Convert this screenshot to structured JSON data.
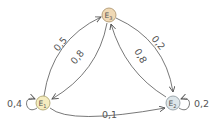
{
  "diagram": {
    "type": "markov-chain",
    "nodes": [
      {
        "id": "E1",
        "label": "E",
        "sub": "1",
        "fill": "#f5ecbf",
        "stroke": "#a89f6a"
      },
      {
        "id": "E2",
        "label": "E",
        "sub": "2",
        "fill": "#dde6ea",
        "stroke": "#8a969c"
      },
      {
        "id": "E3",
        "label": "E",
        "sub": "3",
        "fill": "#f0d9b5",
        "stroke": "#a8916a"
      }
    ],
    "edges": [
      {
        "from": "E1",
        "to": "E3",
        "label": "0,5"
      },
      {
        "from": "E3",
        "to": "E1",
        "label": "0,8"
      },
      {
        "from": "E3",
        "to": "E2",
        "label": "0,2"
      },
      {
        "from": "E2",
        "to": "E3",
        "label": "0,8"
      },
      {
        "from": "E1",
        "to": "E2",
        "label": "0,1"
      },
      {
        "from": "E1",
        "to": "E1",
        "label": "0,4"
      },
      {
        "from": "E2",
        "to": "E2",
        "label": "0,2"
      }
    ]
  }
}
